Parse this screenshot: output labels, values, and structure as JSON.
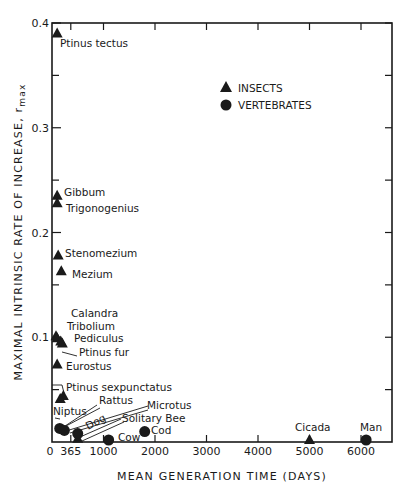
{
  "chart_data": {
    "type": "scatter",
    "title": "",
    "xlabel": "MEAN GENERATION TIME (DAYS)",
    "ylabel": "MAXIMAL INTRINSIC RATE OF INCREASE, r_max",
    "ylabel_main": "MAXIMAL INTRINSIC RATE OF INCREASE, r",
    "ylabel_sub": "max",
    "xlim": [
      0,
      6600
    ],
    "ylim": [
      0,
      0.4
    ],
    "x_ticks": [
      0,
      365,
      1000,
      2000,
      3000,
      4000,
      5000,
      6000
    ],
    "x_tick_labels": [
      "0",
      "365",
      "1000",
      "2000",
      "3000",
      "4000",
      "5000",
      "6000"
    ],
    "y_ticks": [
      0.1,
      0.2,
      0.3,
      0.4
    ],
    "y_tick_labels": [
      "0.1",
      "0.2",
      "0.3",
      "0.4"
    ],
    "grid": false,
    "legend_position": "upper right",
    "legend": [
      {
        "name": "INSECTS",
        "marker": "triangle"
      },
      {
        "name": "VERTEBRATES",
        "marker": "circle"
      }
    ],
    "series": [
      {
        "name": "INSECTS",
        "marker": "triangle",
        "points": [
          {
            "label": "Ptinus tectus",
            "x": 100,
            "y": 0.39
          },
          {
            "label": "Gibbum",
            "x": 100,
            "y": 0.235
          },
          {
            "label": "Trigonogenius",
            "x": 100,
            "y": 0.228
          },
          {
            "label": "Stenomezium",
            "x": 120,
            "y": 0.178
          },
          {
            "label": "Mezium",
            "x": 180,
            "y": 0.163
          },
          {
            "label": "Calandra",
            "x": 30,
            "y": 0.101
          },
          {
            "label": "Tribolium",
            "x": 100,
            "y": 0.099
          },
          {
            "label": "Pediculus",
            "x": 170,
            "y": 0.096
          },
          {
            "label": "Ptinus fur",
            "x": 200,
            "y": 0.094
          },
          {
            "label": "Eurostus",
            "x": 100,
            "y": 0.074
          },
          {
            "label": "Ptinus sexpunctatus",
            "x": 220,
            "y": 0.044
          },
          {
            "label": "Niptus",
            "x": 160,
            "y": 0.041
          },
          {
            "label": "Solitary Bee",
            "x": 500,
            "y": 0.003
          },
          {
            "label": "Cicada",
            "x": 5000,
            "y": 0.002
          }
        ]
      },
      {
        "name": "VERTEBRATES",
        "marker": "circle",
        "points": [
          {
            "label": "Rattus",
            "x": 150,
            "y": 0.013
          },
          {
            "label": "Microtus",
            "x": 240,
            "y": 0.011
          },
          {
            "label": "Dog",
            "x": 500,
            "y": 0.008
          },
          {
            "label": "Cow",
            "x": 1100,
            "y": 0.001
          },
          {
            "label": "Cod",
            "x": 1800,
            "y": 0.01
          },
          {
            "label": "Man",
            "x": 6100,
            "y": 0.001
          }
        ]
      }
    ],
    "annotations": [
      {
        "text": "Ptinus tectus",
        "x": 60,
        "y": 47
      },
      {
        "text": "Gibbum",
        "x": 64,
        "y": 196
      },
      {
        "text": "Trigonogenius",
        "x": 66,
        "y": 212
      },
      {
        "text": "Stenomezium",
        "x": 65,
        "y": 257
      },
      {
        "text": "Mezium",
        "x": 72,
        "y": 278
      },
      {
        "text": "Calandra",
        "x": 71,
        "y": 317
      },
      {
        "text": "Tribolium",
        "x": 67,
        "y": 330
      },
      {
        "text": "Pediculus",
        "x": 74,
        "y": 342
      },
      {
        "text": "Ptinus fur",
        "x": 79,
        "y": 356
      },
      {
        "text": "Eurostus",
        "x": 66,
        "y": 370
      },
      {
        "text": "Ptinus sexpunctatus",
        "x": 66,
        "y": 391
      },
      {
        "text": "Rattus",
        "x": 99,
        "y": 404
      },
      {
        "text": "Microtus",
        "x": 147,
        "y": 409
      },
      {
        "text": "Niptus",
        "x": 53,
        "y": 415
      },
      {
        "text": "Dog",
        "x": 88,
        "y": 430
      },
      {
        "text": "Solitary Bee",
        "x": 122,
        "y": 422
      },
      {
        "text": "Cod",
        "x": 151,
        "y": 434
      },
      {
        "text": "Cow",
        "x": 118,
        "y": 441
      },
      {
        "text": "Cicada",
        "x": 295,
        "y": 431
      },
      {
        "text": "Man",
        "x": 360,
        "y": 431
      }
    ]
  },
  "plot": {
    "left_px": 52,
    "right_px": 392,
    "top_px": 23,
    "bottom_px": 442,
    "ink_color": "#1a1a1a",
    "background": "#ffffff"
  }
}
